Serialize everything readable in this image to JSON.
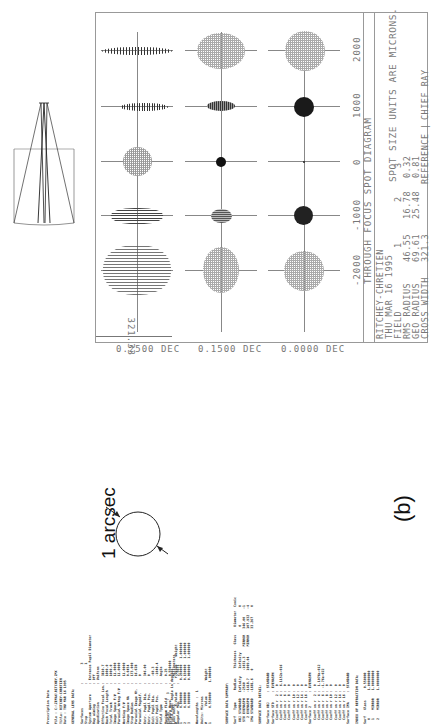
{
  "figure_label": "(b)",
  "scale_annotation": "1 arcsec",
  "spot_diagram": {
    "title": "THROUGH FOCUS SPOT DIAGRAM",
    "units_note": "SPOT SIZE UNITS ARE MICRONS.",
    "scale_bar": "321.33",
    "focus_ticks": [
      "-2000",
      "-1000",
      "0",
      "1000",
      "2000"
    ],
    "fields": [
      "0.2500 DEC",
      "0.1500 DEC",
      "0.0000 DEC"
    ],
    "info": {
      "system": "RITCHEY-CHRETIEN",
      "date": "THU MAR 16 1995",
      "field_label": "FIELD",
      "field_values": [
        "1",
        "2",
        "3"
      ],
      "rms_label": "RMS RADIUS",
      "rms_values": [
        "46.55",
        "16.78",
        "0.32"
      ],
      "geo_label": "GEO RADIUS",
      "geo_values": [
        "69.61",
        "25.48",
        "0.81"
      ],
      "cross_label": "CROSS WIDTH",
      "cross_value": "321.3",
      "reference_label": "REFERENCE",
      "reference_value": "CHIEF RAY"
    }
  },
  "listing": {
    "block1": "Prescription Data\n\nFile : C:\\ZEMAX\\RITCHEY.ZMX\nTitle: RITCHEY-CHRETIEN\nDate : THU MAR 16 1995\n\nGENERAL LENS DATA:\n\nSurfaces            :         3\nStop                :         1\nSystem Aperture     : Entrance Pupil Diameter\nRay aiming          : Off\nApodization         : Uniform\nEffective Focal Len.:   3810.7\nBack Focal Length   :   1000.0\nTotal Track         :   1000.0\nImage Space F/#     :   11.0000\nParaxial Wrkng F/#  :   11.0000\nWorking F/#         :   11.0000\nImage Space NA      :   0.0454\nStop Radius         :   173.000\nParaxial Image Ht.  :   16.628\nParaxial Magnif.    :   0\nEntr. Pupil Dia.    :   346.00\nEntr. Pupil Pos.    :   0\nExit Pupil Dia.     :   -60.3\nExit Pupil Pos.     :   -1040.4\nField Type          :   Angle\nMaximum Field       :   0.25\nPrimary Wave        :   0.550000\nLens Units          :   Millimeters\nAngular Mag.        :   2.5671",
    "block2": "Fields      :  3\nField Type: Angle in degrees\n#        X-Value       Y-Value    Weight\n1       0.000000      0.250000   1.000000\n2       0.000000      0.150000   1.000000\n3       0.000000      0.000000   1.000000\n\nWavelengths  :  1\nUnits: Microns\n#        Value        Weight\n1       0.550000     1.000000",
    "block3": "SURFACE DATA SUMMARY:\n\nSurf   Type      Radius     Thickness   Glass    Diameter  Conic\n OBJ STANDARD   Infinity    Infinity             0         0\n STO EVENASPH   -2540      -1031.3     MIRROR   346.00    -1\n   2 EVENASPH   -1418.7    1009.04     MIRROR   107.932   -4\n IMA STANDARD   -1681.6    0                    33.267     0",
    "block4": "SURFACE DATA DETAIL:\n\nSurface OBJ     : STANDARD\nSurface STO     : EVENASPH\n  Coeff on r  2 :  0\n  Coeff on r  4 :  6.1152e-016\n  Coeff on r  6 :  0\n  Coeff on r  8 :  0\n  Coeff on r 10 :  0\n  Coeff on r 12 :  0\n  Coeff on r 14 :  0\n  Coeff on r 16 :  0\nSurface 2       : EVENASPH\n  Coeff on r  2 :  0\n  Coeff on r  4 :  1.1076e-012\n  Coeff on r  6 : -1.76e-022\n  Coeff on r  8 :  0\n  Coeff on r 10 :  0\n  Coeff on r 12 :  0\n  Coeff on r 14 :  0\n  Coeff on r 16 :  0\nSurface IMA     : STANDARD\n\nINDEX OF REFRACTION DATA:\n\nSurf   Glass      0.550000\n  0              1.00000000\n  1    MIRROR    1.00000000\n  2    MIRROR    1.00000000"
  }
}
